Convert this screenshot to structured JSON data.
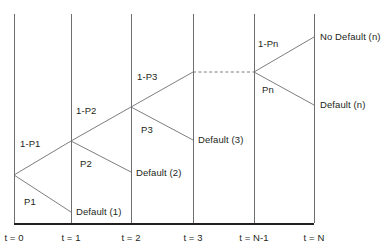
{
  "diagram": {
    "type": "binomial-default-probability-tree",
    "colors": {
      "line": "#6d6e71",
      "axis": "#231f20",
      "text": "#231f20",
      "background": "#ffffff"
    },
    "time_axis": {
      "ticks": [
        {
          "id": "t0",
          "label": "t = 0",
          "x": 14
        },
        {
          "id": "t1",
          "label": "t = 1",
          "x": 71
        },
        {
          "id": "t2",
          "label": "t = 2",
          "x": 131
        },
        {
          "id": "t3",
          "label": "t = 3",
          "x": 193
        },
        {
          "id": "tNm1",
          "label": "t = N-1",
          "x": 254
        },
        {
          "id": "tN",
          "label": "t = N",
          "x": 314
        }
      ],
      "baseline_y": 224,
      "label_y": 232,
      "grid_top_y": 14
    },
    "nodes": [
      {
        "id": "root",
        "x": 14,
        "y": 175
      },
      {
        "id": "survive1",
        "x": 71,
        "y": 141
      },
      {
        "id": "survive2",
        "x": 131,
        "y": 107
      },
      {
        "id": "survive3",
        "x": 193,
        "y": 72
      },
      {
        "id": "surviveNm1",
        "x": 254,
        "y": 72
      },
      {
        "id": "default1",
        "x": 71,
        "y": 212
      },
      {
        "id": "default2",
        "x": 131,
        "y": 172
      },
      {
        "id": "default3",
        "x": 193,
        "y": 140
      },
      {
        "id": "nodefaultN",
        "x": 314,
        "y": 37
      },
      {
        "id": "defaultN",
        "x": 314,
        "y": 105
      }
    ],
    "branch_labels": [
      {
        "id": "p1-survive",
        "text": "1-P1",
        "x": 20,
        "y": 138
      },
      {
        "id": "p1-default",
        "text": "P1",
        "x": 24,
        "y": 196
      },
      {
        "id": "p2-survive",
        "text": "1-P2",
        "x": 76,
        "y": 105
      },
      {
        "id": "p2-default",
        "text": "P2",
        "x": 80,
        "y": 158
      },
      {
        "id": "p3-survive",
        "text": "1-P3",
        "x": 137,
        "y": 71
      },
      {
        "id": "p3-default",
        "text": "P3",
        "x": 141,
        "y": 124
      },
      {
        "id": "pn-survive",
        "text": "1-Pn",
        "x": 258,
        "y": 38
      },
      {
        "id": "pn-default",
        "text": "Pn",
        "x": 262,
        "y": 84
      }
    ],
    "outcome_labels": [
      {
        "id": "default-1",
        "text": "Default (1)",
        "x": 76,
        "y": 206
      },
      {
        "id": "default-2",
        "text": "Default (2)",
        "x": 136,
        "y": 167
      },
      {
        "id": "default-3",
        "text": "Default (3)",
        "x": 198,
        "y": 134
      },
      {
        "id": "no-default-n",
        "text": "No Default (n)",
        "x": 320,
        "y": 31
      },
      {
        "id": "default-n",
        "text": "Default (n)",
        "x": 320,
        "y": 99
      }
    ],
    "dashed_connector": {
      "from_x": 193,
      "to_x": 254,
      "y": 72
    }
  }
}
